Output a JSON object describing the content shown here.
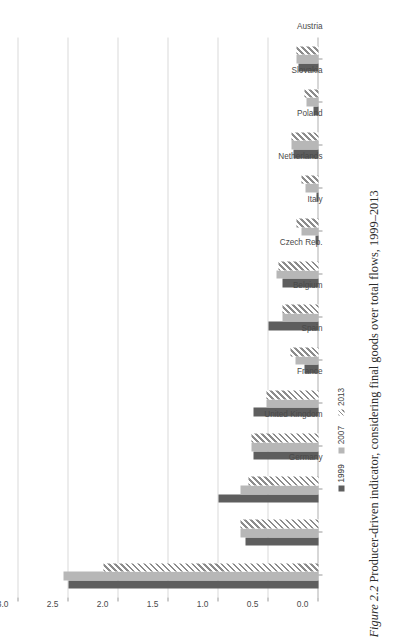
{
  "figure": {
    "number_label": "Figure 2.2",
    "caption_text": "Producer-driven indicator, considering final goods over total flows, 1999–2013"
  },
  "legend": {
    "position": "bottom-left",
    "entries": [
      {
        "label": "1999",
        "swatch": "solid-dark-gray",
        "color": "#5e5e5e"
      },
      {
        "label": "2007",
        "swatch": "solid-light-gray",
        "color": "#b7b7b7"
      },
      {
        "label": "2013",
        "swatch": "diagonal-hatch",
        "color": "#8c8c8c"
      }
    ]
  },
  "chart_data": {
    "type": "bar",
    "title": "",
    "xlabel": "",
    "ylabel": "",
    "orientation": "vertical-columns-rendered-rotated",
    "grid": true,
    "legend_position": "bottom-left",
    "ylim": [
      0.0,
      3.0
    ],
    "yticks": [
      "0.0",
      "0.5",
      "1.0",
      "1.5",
      "2.0",
      "2.5",
      "3.0"
    ],
    "ytick_values": [
      0.0,
      0.5,
      1.0,
      1.5,
      2.0,
      2.5,
      3.0
    ],
    "categories": [
      "Germany",
      "United Kingdom",
      "France",
      "Spain",
      "Belgium",
      "Czech Rep.",
      "Italy",
      "Netherlands",
      "Poland",
      "Slovakia",
      "Austria",
      "Hungary",
      "Sweden"
    ],
    "series": [
      {
        "name": "1999",
        "values": [
          2.5,
          0.73,
          1.0,
          0.65,
          0.65,
          0.14,
          0.5,
          0.36,
          0.03,
          0.02,
          0.25,
          0.05,
          0.2
        ]
      },
      {
        "name": "2007",
        "values": [
          2.55,
          0.78,
          0.78,
          0.67,
          0.52,
          0.23,
          0.36,
          0.42,
          0.17,
          0.13,
          0.27,
          0.12,
          0.22
        ]
      },
      {
        "name": "2013",
        "values": [
          2.15,
          0.78,
          0.7,
          0.67,
          0.52,
          0.28,
          0.36,
          0.4,
          0.22,
          0.17,
          0.27,
          0.14,
          0.22
        ]
      }
    ]
  }
}
